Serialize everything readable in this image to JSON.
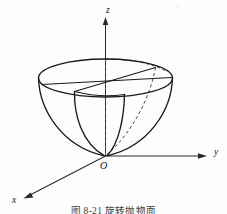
{
  "figure": {
    "type": "math-diagram",
    "background_color": "#fdfdfd",
    "line_color": "#1a1a1a",
    "hidden_line_color": "#4a4a4a",
    "axes": {
      "z": {
        "label": "z",
        "label_x": 106,
        "label_y": 13,
        "direction": "up",
        "arrow": true
      },
      "y": {
        "label": "y",
        "label_x": 214,
        "label_y": 155,
        "direction": "right",
        "arrow": true
      },
      "x": {
        "label": "x",
        "label_x": 14,
        "label_y": 202,
        "direction": "lower-left",
        "arrow": true
      },
      "origin": {
        "label": "O",
        "label_x": 101,
        "label_y": 168,
        "point_x": 105,
        "point_y": 156
      }
    },
    "shape": {
      "name": "paraboloid-of-revolution",
      "rim_center_x": 105,
      "rim_center_y": 78,
      "rim_radius_x": 67,
      "rim_radius_y": 19,
      "apex_x": 105,
      "apex_y": 156,
      "cut_quadrant": true,
      "visible_curves": [
        "rim-ellipse-front",
        "rim-ellipse-back",
        "outer-parabola-left",
        "outer-parabola-right",
        "cut-parabola-front",
        "cut-parabola-right",
        "cut-radius-left",
        "cut-radius-right"
      ],
      "hidden_curves": [
        "z-axis-dashed-interior",
        "rim-ellipse-interior-arc"
      ]
    }
  },
  "caption": {
    "text": "图 8-21  旋转抛物面",
    "clipped": true
  }
}
